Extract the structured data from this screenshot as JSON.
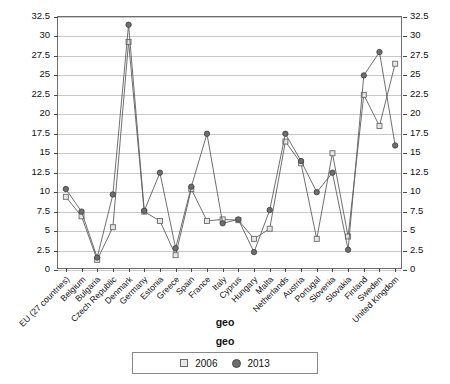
{
  "chart_data": {
    "type": "line",
    "title": "",
    "xlabel": "geo",
    "ylabel": "",
    "ylim": [
      0,
      32.5
    ],
    "yticks": [
      0,
      2.5,
      5,
      7.5,
      10,
      12.5,
      15,
      17.5,
      20,
      22.5,
      25,
      27.5,
      30,
      32.5
    ],
    "ytick_labels": [
      "0",
      "2.5",
      "5",
      "7.5",
      "10",
      "12.5",
      "15",
      "17.5",
      "20",
      "22.5",
      "25",
      "27.5",
      "30",
      "32.5"
    ],
    "dual_axis": true,
    "grid": true,
    "legend_title": "geo",
    "legend_position": "bottom",
    "categories": [
      "EU (27 countries)",
      "Belgium",
      "Bulgaria",
      "Czech Republic",
      "Denmark",
      "Germany",
      "Estonia",
      "Greece",
      "Spain",
      "France",
      "Italy",
      "Cyprus",
      "Hungary",
      "Malta",
      "Netherlands",
      "Austria",
      "Portugal",
      "Slovenia",
      "Slovakia",
      "Finland",
      "Sweden",
      "United Kingdom"
    ],
    "series": [
      {
        "name": "2006",
        "marker": "open-square",
        "color": "#6b6b6b",
        "values": [
          9.4,
          6.9,
          1.3,
          5.5,
          29.3,
          7.5,
          6.3,
          1.9,
          10.4,
          6.3,
          6.5,
          6.4,
          4.0,
          5.3,
          16.5,
          13.7,
          4.0,
          15.0,
          4.3,
          22.5,
          18.5,
          26.5
        ]
      },
      {
        "name": "2013",
        "marker": "filled-circle",
        "color": "#6e6e6e",
        "values": [
          10.4,
          7.5,
          1.6,
          9.7,
          31.5,
          7.6,
          12.5,
          2.8,
          10.7,
          17.5,
          6.0,
          6.5,
          2.3,
          7.7,
          17.5,
          14.0,
          10.0,
          12.5,
          2.6,
          25.0,
          28.0,
          16.0
        ]
      }
    ]
  },
  "legend": {
    "title": "geo",
    "entries": [
      {
        "label": "2006"
      },
      {
        "label": "2013"
      }
    ]
  }
}
